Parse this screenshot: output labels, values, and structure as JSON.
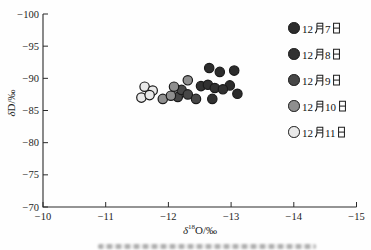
{
  "figure": {
    "background": "#fefefe",
    "axis_color": "#2a2a2a",
    "text_color": "#1d1d1d",
    "marker_outline": "#1a1a1a"
  },
  "labels": {
    "xlabel_delta": "δ",
    "xlabel_sup": "18",
    "xlabel_rest": "O/‰",
    "ylabel_delta": "δ",
    "ylabel_rest": "D/‰"
  },
  "chart_data": {
    "type": "scatter",
    "title": "",
    "xlabel": "δ¹⁸O/‰",
    "ylabel": "δD/‰",
    "xlim": [
      -10,
      -15
    ],
    "ylim": [
      -100,
      -70
    ],
    "x_ticks": [
      -10,
      -11,
      -12,
      -13,
      -14,
      -15
    ],
    "y_ticks": [
      -100,
      -95,
      -90,
      -85,
      -80,
      -75,
      -70
    ],
    "x_axis_reversed": true,
    "y_axis_reversed": true,
    "grid": false,
    "legend_position": "upper-right",
    "series": [
      {
        "name": "12月7日",
        "month": "12",
        "day": "7",
        "fill": "#2c2c2c",
        "points": [
          [
            -12.65,
            -91.6
          ],
          [
            -12.82,
            -91.0
          ],
          [
            -13.05,
            -91.2
          ],
          [
            -12.98,
            -88.9
          ],
          [
            -13.1,
            -87.6
          ]
        ]
      },
      {
        "name": "12月8日",
        "month": "12",
        "day": "8",
        "fill": "#313131",
        "points": [
          [
            -12.52,
            -88.8
          ],
          [
            -12.63,
            -89.0
          ],
          [
            -12.74,
            -88.5
          ],
          [
            -12.87,
            -88.3
          ],
          [
            -12.7,
            -86.8
          ]
        ]
      },
      {
        "name": "12月9日",
        "month": "12",
        "day": "9",
        "fill": "#474747",
        "points": [
          [
            -12.15,
            -87.1
          ],
          [
            -12.21,
            -88.2
          ],
          [
            -12.31,
            -87.5
          ],
          [
            -12.44,
            -86.8
          ]
        ]
      },
      {
        "name": "12月10日",
        "month": "12",
        "day": "10",
        "fill": "#8f8f8f",
        "points": [
          [
            -11.91,
            -86.8
          ],
          [
            -12.04,
            -87.3
          ],
          [
            -12.09,
            -88.7
          ],
          [
            -12.31,
            -89.7
          ]
        ]
      },
      {
        "name": "12月11日",
        "month": "12",
        "day": "11",
        "fill": "#e9e9e9",
        "points": [
          [
            -11.62,
            -88.7
          ],
          [
            -11.75,
            -88.1
          ],
          [
            -11.57,
            -87.0
          ],
          [
            -11.7,
            -87.4
          ]
        ]
      }
    ]
  }
}
